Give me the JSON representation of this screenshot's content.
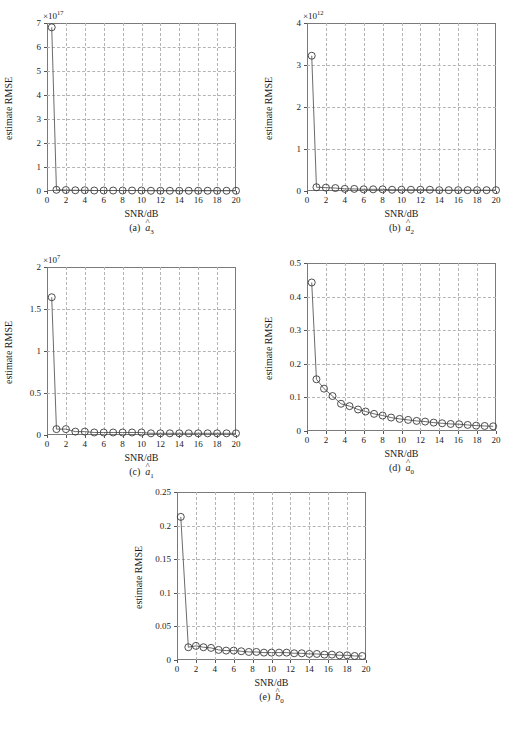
{
  "figure": {
    "axis_labels": {
      "x": "SNR/dB",
      "y": "estimate RMSE"
    },
    "bottom_caption": ""
  },
  "chart_data": [
    {
      "id": "a",
      "type": "line",
      "title": "",
      "caption_prefix": "(a)",
      "caption_symbol": "a",
      "caption_sub": "3",
      "caption_hat": "^",
      "xlabel": "SNR/dB",
      "ylabel": "estimate RMSE",
      "exponent_label": "×10",
      "exponent_power": "17",
      "scale": 1e+17,
      "xlim": [
        0,
        20
      ],
      "ylim": [
        0,
        7
      ],
      "xticks": [
        0,
        2,
        4,
        6,
        8,
        10,
        12,
        14,
        16,
        18,
        20
      ],
      "yticks": [
        0,
        1,
        2,
        3,
        4,
        5,
        6,
        7
      ],
      "grid": true,
      "marker": "circle",
      "x": [
        0.5,
        1,
        2,
        3,
        4,
        5,
        6,
        7,
        8,
        9,
        10,
        11,
        12,
        13,
        14,
        15,
        16,
        17,
        18,
        19,
        20
      ],
      "values": [
        6.82,
        0.05,
        0.04,
        0.03,
        0.03,
        0.02,
        0.02,
        0.02,
        0.02,
        0.02,
        0.02,
        0.01,
        0.01,
        0.01,
        0.01,
        0.01,
        0.01,
        0.01,
        0.01,
        0.01,
        0.01
      ]
    },
    {
      "id": "b",
      "type": "line",
      "title": "",
      "caption_prefix": "(b)",
      "caption_symbol": "a",
      "caption_sub": "2",
      "caption_hat": "^",
      "xlabel": "SNR/dB",
      "ylabel": "estimate RMSE",
      "exponent_label": "×10",
      "exponent_power": "12",
      "scale": 1000000000000.0,
      "xlim": [
        0,
        20
      ],
      "ylim": [
        0,
        4
      ],
      "xticks": [
        0,
        2,
        4,
        6,
        8,
        10,
        12,
        14,
        16,
        18,
        20
      ],
      "yticks": [
        0,
        1,
        2,
        3,
        4
      ],
      "grid": true,
      "marker": "circle",
      "x": [
        0.5,
        1,
        2,
        3,
        4,
        5,
        6,
        7,
        8,
        9,
        10,
        11,
        12,
        13,
        14,
        15,
        16,
        17,
        18,
        19,
        20
      ],
      "values": [
        3.22,
        0.09,
        0.08,
        0.07,
        0.05,
        0.05,
        0.04,
        0.04,
        0.04,
        0.03,
        0.03,
        0.03,
        0.03,
        0.03,
        0.02,
        0.02,
        0.02,
        0.02,
        0.02,
        0.02,
        0.02
      ]
    },
    {
      "id": "c",
      "type": "line",
      "title": "",
      "caption_prefix": "(c)",
      "caption_symbol": "a",
      "caption_sub": "1",
      "caption_hat": "^",
      "xlabel": "SNR/dB",
      "ylabel": "estimate RMSE",
      "exponent_label": "×10",
      "exponent_power": "7",
      "scale": 10000000,
      "xlim": [
        0,
        20
      ],
      "ylim": [
        0,
        2
      ],
      "xticks": [
        0,
        2,
        4,
        6,
        8,
        10,
        12,
        14,
        16,
        18,
        20
      ],
      "yticks": [
        0,
        0.5,
        1,
        1.5,
        2
      ],
      "ytick_labels": [
        "0",
        "0.5",
        "1",
        "1.5",
        "2"
      ],
      "grid": true,
      "marker": "circle",
      "x": [
        0.5,
        1,
        2,
        3,
        4,
        5,
        6,
        7,
        8,
        9,
        10,
        11,
        12,
        13,
        14,
        15,
        16,
        17,
        18,
        19,
        20
      ],
      "values": [
        1.64,
        0.07,
        0.07,
        0.04,
        0.04,
        0.03,
        0.03,
        0.03,
        0.03,
        0.03,
        0.03,
        0.02,
        0.02,
        0.02,
        0.02,
        0.02,
        0.02,
        0.02,
        0.02,
        0.02,
        0.02
      ]
    },
    {
      "id": "d",
      "type": "line",
      "title": "",
      "caption_prefix": "(d)",
      "caption_symbol": "a",
      "caption_sub": "0",
      "caption_hat": "^",
      "xlabel": "SNR/dB",
      "ylabel": "estimate RMSE",
      "exponent_label": "",
      "exponent_power": "",
      "scale": 1,
      "xlim": [
        0,
        20
      ],
      "ylim": [
        0,
        0.5
      ],
      "xticks": [
        0,
        2,
        4,
        6,
        8,
        10,
        12,
        14,
        16,
        18,
        20
      ],
      "yticks": [
        0,
        0.1,
        0.2,
        0.3,
        0.4,
        0.5
      ],
      "ytick_labels": [
        "0",
        "0.1",
        "0.2",
        "0.3",
        "0.4",
        "0.5"
      ],
      "grid": true,
      "marker": "circle",
      "x": [
        0.5,
        1,
        1.8,
        2.7,
        3.6,
        4.5,
        5.4,
        6.2,
        7.1,
        8,
        8.9,
        9.8,
        10.7,
        11.6,
        12.5,
        13.4,
        14.3,
        15.2,
        16.1,
        17,
        17.9,
        18.8,
        19.7
      ],
      "values": [
        0.442,
        0.154,
        0.126,
        0.104,
        0.081,
        0.074,
        0.064,
        0.058,
        0.051,
        0.046,
        0.04,
        0.036,
        0.033,
        0.03,
        0.028,
        0.025,
        0.023,
        0.021,
        0.02,
        0.018,
        0.016,
        0.015,
        0.014
      ]
    },
    {
      "id": "e",
      "type": "line",
      "title": "",
      "caption_prefix": "(e)",
      "caption_symbol": "b",
      "caption_sub": "0",
      "caption_hat": "^",
      "xlabel": "SNR/dB",
      "ylabel": "estimate RMSE",
      "exponent_label": "",
      "exponent_power": "",
      "scale": 1,
      "xlim": [
        0,
        20
      ],
      "ylim": [
        0,
        0.25
      ],
      "xticks": [
        0,
        2,
        4,
        6,
        8,
        10,
        12,
        14,
        16,
        18,
        20
      ],
      "yticks": [
        0,
        0.05,
        0.1,
        0.15,
        0.2,
        0.25
      ],
      "ytick_labels": [
        "0",
        "0.05",
        "0.1",
        "0.15",
        "0.2",
        "0.25"
      ],
      "grid": true,
      "marker": "circle",
      "x": [
        0.4,
        1.2,
        2,
        2.8,
        3.6,
        4.4,
        5.2,
        6,
        6.8,
        7.6,
        8.4,
        9.2,
        10,
        10.8,
        11.6,
        12.4,
        13.2,
        14,
        14.8,
        15.6,
        16.4,
        17.2,
        18,
        18.8,
        19.6
      ],
      "values": [
        0.213,
        0.019,
        0.021,
        0.019,
        0.018,
        0.015,
        0.014,
        0.014,
        0.013,
        0.012,
        0.012,
        0.011,
        0.011,
        0.011,
        0.011,
        0.01,
        0.01,
        0.009,
        0.009,
        0.008,
        0.008,
        0.007,
        0.007,
        0.006,
        0.006
      ]
    }
  ]
}
